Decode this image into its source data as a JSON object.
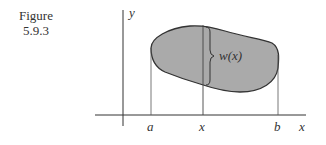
{
  "caption": {
    "line1": "Figure",
    "line2": "5.9.3"
  },
  "axes": {
    "x_label": "x",
    "y_label": "y"
  },
  "markers": {
    "a": "a",
    "x": "x",
    "b": "b"
  },
  "width_label": "w(x)",
  "colors": {
    "fill": "#aaaaaa",
    "stroke": "#333333"
  }
}
